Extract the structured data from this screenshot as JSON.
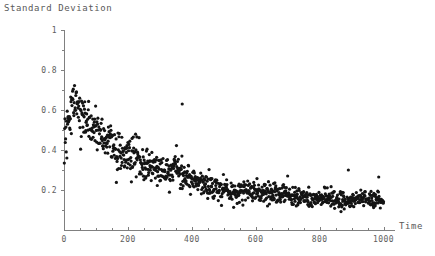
{
  "chart_data": {
    "type": "scatter",
    "title": "Standard Deviation",
    "ylabel": "Standard Deviation",
    "xlabel": "Time",
    "grid": false,
    "legend": null,
    "xlim": [
      0,
      1040
    ],
    "ylim": [
      0,
      1
    ],
    "xticks": [
      0,
      200,
      400,
      600,
      800,
      1000
    ],
    "xtick_labels": [
      "0",
      "200",
      "400",
      "600",
      "800",
      "1000"
    ],
    "yticks": [
      0,
      0.2,
      0.4,
      0.6,
      0.8,
      1
    ],
    "ytick_labels": [
      "",
      "0.2",
      "0.4",
      "0.6",
      "0.8",
      "1"
    ],
    "marker": "point",
    "marker_color": "#141414",
    "marker_size": 1.6,
    "n_points": 1000,
    "trend": {
      "t0_value": 0.35,
      "peak_time": 30,
      "peak_value": 0.6,
      "asymptote": 0.135,
      "decay_constant": 260
    },
    "outliers": [
      {
        "x": 370,
        "y": 0.63
      },
      {
        "x": 345,
        "y": 0.33
      },
      {
        "x": 890,
        "y": 0.3
      },
      {
        "x": 700,
        "y": 0.27
      },
      {
        "x": 985,
        "y": 0.265
      }
    ]
  },
  "axes": {
    "x_axis_name": "time-axis",
    "y_axis_name": "standard-deviation-axis"
  }
}
